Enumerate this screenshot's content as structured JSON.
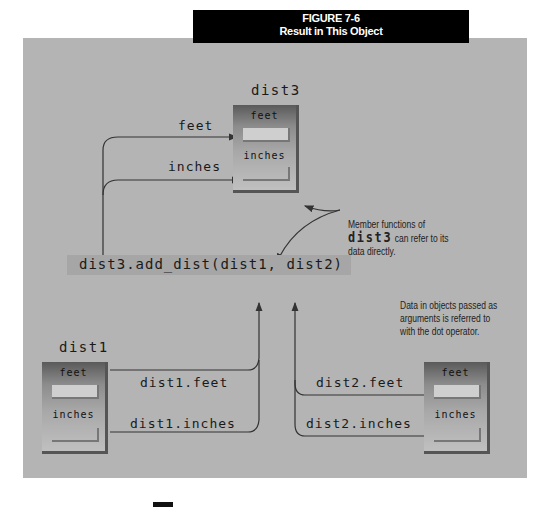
{
  "figure": {
    "number": "FIGURE 7-6",
    "caption": "Result in This Object"
  },
  "objects": {
    "dist3": {
      "name": "dist3",
      "field1": "feet",
      "field2": "inches"
    },
    "dist1": {
      "name": "dist1",
      "field1": "feet",
      "field2": "inches"
    },
    "dist2": {
      "name": "dist2",
      "field1": "feet",
      "field2": "inches"
    }
  },
  "labels": {
    "feet": "feet",
    "inches": "inches",
    "dist1_feet": "dist1.feet",
    "dist1_inches": "dist1.inches",
    "dist2_feet": "dist2.feet",
    "dist2_inches": "dist2.inches"
  },
  "call": "dist3.add_dist(dist1, dist2)",
  "notes": {
    "member": {
      "line1": "Member functions of",
      "code": "dist3",
      "line2_rest": " can refer to its",
      "line3": "data directly."
    },
    "args": {
      "line1": "Data in objects passed as",
      "line2": "arguments is referred to",
      "line3": "with the dot operator."
    }
  },
  "colors": {
    "panel": "#b4b4b4",
    "title_bg": "#000000",
    "call_bg": "#a6a6a6"
  }
}
